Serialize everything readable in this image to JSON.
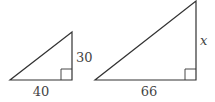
{
  "figure": {
    "type": "similar right triangles",
    "stroke_color": "#333333",
    "label_color": "#444444",
    "triangles": [
      {
        "name": "small",
        "base_label": "40",
        "height_label": "30",
        "right_angle": true
      },
      {
        "name": "large",
        "base_label": "66",
        "height_label": "x",
        "right_angle": true
      }
    ]
  }
}
